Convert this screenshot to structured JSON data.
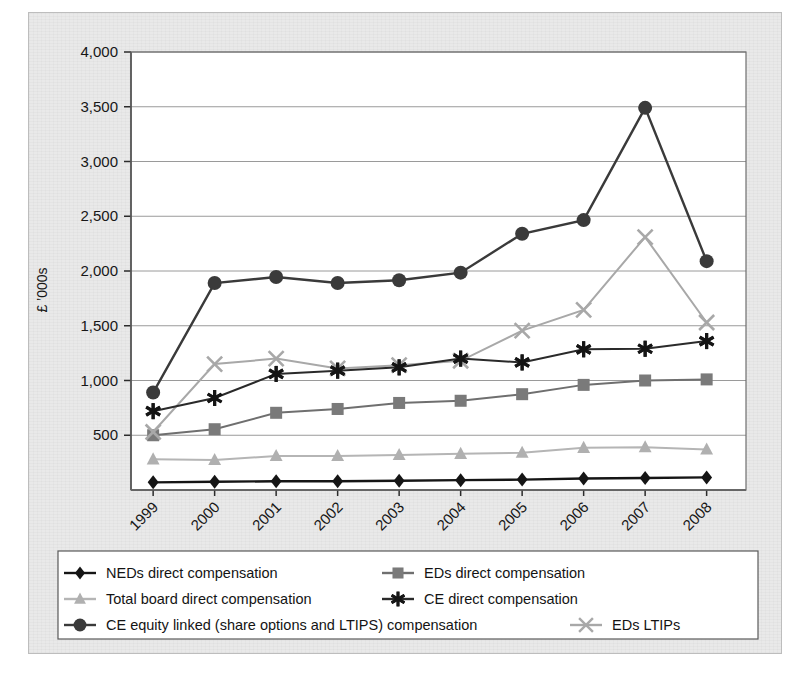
{
  "figure": {
    "background_color": "#e9e9e9",
    "plot_background_color": "#ffffff"
  },
  "chart_data": {
    "type": "line",
    "title": "",
    "xlabel": "",
    "ylabel": "£ ’000s",
    "categories": [
      "1999",
      "2000",
      "2001",
      "2002",
      "2003",
      "2004",
      "2005",
      "2006",
      "2007",
      "2008"
    ],
    "x": [
      1999,
      2000,
      2001,
      2002,
      2003,
      2004,
      2005,
      2006,
      2007,
      2008
    ],
    "ylim": [
      0,
      4000
    ],
    "yticks": [
      0,
      500,
      1000,
      1500,
      2000,
      2500,
      3000,
      3500,
      4000
    ],
    "ytick_labels": [
      "",
      "500",
      "1,000",
      "1,500",
      "2,000",
      "2,500",
      "3,000",
      "3,500",
      "4,000"
    ],
    "grid": true,
    "grid_axis": "y",
    "legend_position": "bottom",
    "xtick_rotation": 45,
    "series": [
      {
        "name": "NEDs direct compensation",
        "marker": "diamond",
        "color": "#151515",
        "line_color": "#151515",
        "values": [
          70,
          75,
          80,
          80,
          85,
          90,
          95,
          105,
          110,
          115
        ]
      },
      {
        "name": "EDs direct compensation",
        "marker": "square",
        "color": "#7a7a7a",
        "line_color": "#6f6f6f",
        "values": [
          500,
          555,
          705,
          740,
          795,
          815,
          875,
          960,
          1000,
          1010
        ]
      },
      {
        "name": "Total board direct compensation",
        "marker": "triangle",
        "color": "#b0b0b0",
        "line_color": "#b5b5b5",
        "values": [
          280,
          275,
          310,
          310,
          320,
          330,
          340,
          385,
          390,
          370
        ]
      },
      {
        "name": "CE direct compensation",
        "marker": "asterisk",
        "color": "#151515",
        "line_color": "#2a2a2a",
        "values": [
          720,
          840,
          1060,
          1090,
          1120,
          1200,
          1165,
          1285,
          1290,
          1360
        ]
      },
      {
        "name": "CE equity linked (share options and LTIPS) compensation",
        "marker": "circle",
        "color": "#3a3a3a",
        "line_color": "#3a3a3a",
        "values": [
          890,
          1890,
          1945,
          1890,
          1915,
          1985,
          2340,
          2465,
          3490,
          2090
        ]
      },
      {
        "name": "EDs LTIPs",
        "marker": "cross",
        "color": "#a8a8a8",
        "line_color": "#a8a8a8",
        "values": [
          530,
          1150,
          1200,
          1110,
          1140,
          1180,
          1455,
          1645,
          2310,
          1530
        ]
      }
    ]
  },
  "legend": {
    "rows": [
      [
        {
          "label": "NEDs direct compensation",
          "series": 0
        },
        {
          "label": "EDs direct compensation",
          "series": 1
        }
      ],
      [
        {
          "label": "Total board direct compensation",
          "series": 2
        },
        {
          "label": "CE direct compensation",
          "series": 3
        }
      ],
      [
        {
          "label": "CE equity linked (share options and LTIPS) compensation",
          "series": 4
        },
        {
          "label": "EDs LTIPs",
          "series": 5
        }
      ]
    ]
  }
}
